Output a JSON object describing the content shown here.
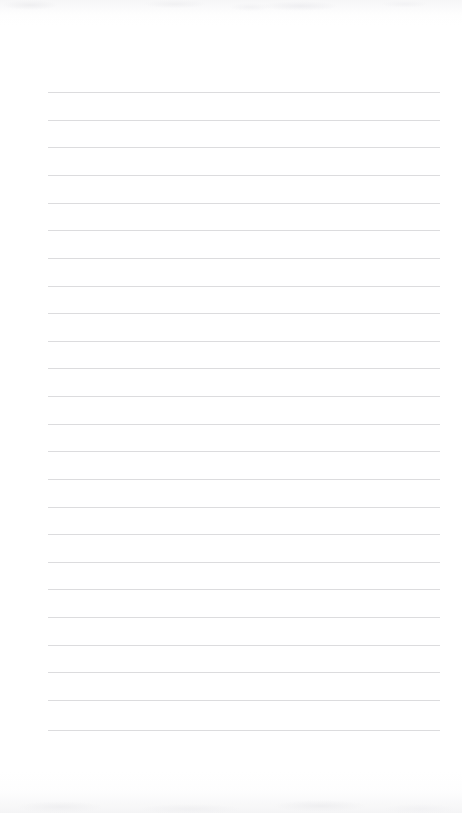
{
  "document": {
    "kind": "lined-paper",
    "title": "Blank ruled notepad page",
    "content_text": "",
    "page_background_color": "#ffffff",
    "rule_color": "#dcdcde",
    "page_width": 462,
    "page_height": 813
  },
  "layout": {
    "rule_left_x": 48,
    "rule_right_x": 440,
    "rule_width": 392,
    "first_rule_y": 92,
    "rule_spacing": 27.7,
    "rule_thickness": 1,
    "left_margin": 48,
    "right_margin": 22,
    "top_margin": 92,
    "bottom_margin": 83,
    "rule_count": 24
  },
  "rules": [
    {
      "index": 1,
      "y": 92,
      "label": "ruled-line-1"
    },
    {
      "index": 2,
      "y": 120,
      "label": "ruled-line-2"
    },
    {
      "index": 3,
      "y": 147,
      "label": "ruled-line-3"
    },
    {
      "index": 4,
      "y": 175,
      "label": "ruled-line-4"
    },
    {
      "index": 5,
      "y": 203,
      "label": "ruled-line-5"
    },
    {
      "index": 6,
      "y": 230,
      "label": "ruled-line-6"
    },
    {
      "index": 7,
      "y": 258,
      "label": "ruled-line-7"
    },
    {
      "index": 8,
      "y": 286,
      "label": "ruled-line-8"
    },
    {
      "index": 9,
      "y": 313,
      "label": "ruled-line-9"
    },
    {
      "index": 10,
      "y": 341,
      "label": "ruled-line-10"
    },
    {
      "index": 11,
      "y": 368,
      "label": "ruled-line-11"
    },
    {
      "index": 12,
      "y": 396,
      "label": "ruled-line-12"
    },
    {
      "index": 13,
      "y": 424,
      "label": "ruled-line-13"
    },
    {
      "index": 14,
      "y": 451,
      "label": "ruled-line-14"
    },
    {
      "index": 15,
      "y": 479,
      "label": "ruled-line-15"
    },
    {
      "index": 16,
      "y": 507,
      "label": "ruled-line-16"
    },
    {
      "index": 17,
      "y": 534,
      "label": "ruled-line-17"
    },
    {
      "index": 18,
      "y": 562,
      "label": "ruled-line-18"
    },
    {
      "index": 19,
      "y": 589,
      "label": "ruled-line-19"
    },
    {
      "index": 20,
      "y": 617,
      "label": "ruled-line-20"
    },
    {
      "index": 21,
      "y": 645,
      "label": "ruled-line-21"
    },
    {
      "index": 22,
      "y": 672,
      "label": "ruled-line-22"
    },
    {
      "index": 23,
      "y": 700,
      "label": "ruled-line-23"
    },
    {
      "index": 24,
      "y": 730,
      "label": "ruled-line-24"
    }
  ],
  "lines_text": [
    "",
    "",
    "",
    "",
    "",
    "",
    "",
    "",
    "",
    "",
    "",
    "",
    "",
    "",
    "",
    "",
    "",
    "",
    "",
    "",
    "",
    "",
    "",
    ""
  ]
}
